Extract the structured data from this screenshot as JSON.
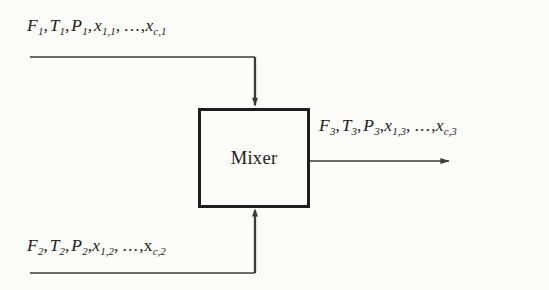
{
  "diagram": {
    "background_color": "#fbfbf8",
    "line_color": "#3a3a3a",
    "unit": {
      "name": "Mixer",
      "label": "Mixer",
      "shape": "rectangle",
      "x": 198,
      "y": 108,
      "width": 112,
      "height": 100,
      "border_color": "#1e1e1e",
      "border_width": 3,
      "fill": "none"
    },
    "streams": [
      {
        "id": "stream-1",
        "role": "inlet",
        "number": 1,
        "label_parts": [
          "F",
          "1",
          ", ",
          "T",
          "1",
          ", ",
          "P",
          "1",
          ", ",
          "x",
          "1,1",
          " , ",
          "...",
          ", ",
          "x",
          "c,1"
        ],
        "label_plain": "F1, T1, P1, x1,1 , ... , xc,1",
        "variables": [
          {
            "symbol": "F",
            "subscript": "1"
          },
          {
            "symbol": "T",
            "subscript": "1"
          },
          {
            "symbol": "P",
            "subscript": "1"
          },
          {
            "symbol": "x",
            "subscript": "1,1"
          },
          {
            "symbol": "ellipsis",
            "subscript": ""
          },
          {
            "symbol": "x",
            "subscript": "c,1"
          }
        ],
        "enters_at": "top",
        "arrow_direction": "down"
      },
      {
        "id": "stream-2",
        "role": "inlet",
        "number": 2,
        "label_parts": [
          "F",
          "2",
          ", ",
          "T",
          "2",
          ", ",
          "P",
          "2",
          ", ",
          "x",
          "1,2",
          " , ",
          "...",
          ", ",
          "x",
          "c,2"
        ],
        "label_plain": "F2, T2, P2, x1,2 , ... , xc,2",
        "variables": [
          {
            "symbol": "F",
            "subscript": "2"
          },
          {
            "symbol": "T",
            "subscript": "2"
          },
          {
            "symbol": "P",
            "subscript": "2"
          },
          {
            "symbol": "x",
            "subscript": "1,2"
          },
          {
            "symbol": "ellipsis",
            "subscript": ""
          },
          {
            "symbol": "x",
            "subscript": "c,2"
          }
        ],
        "enters_at": "bottom",
        "arrow_direction": "up"
      },
      {
        "id": "stream-3",
        "role": "outlet",
        "number": 3,
        "label_parts": [
          "F",
          "3",
          ", ",
          "T",
          "3",
          ", ",
          "P",
          "3",
          ", ",
          "x",
          "1,3",
          " , ",
          "...",
          ", ",
          "x",
          "c,3"
        ],
        "label_plain": "F3, T3, P3, x1,3 , ... , xc,3",
        "variables": [
          {
            "symbol": "F",
            "subscript": "3"
          },
          {
            "symbol": "T",
            "subscript": "3"
          },
          {
            "symbol": "P",
            "subscript": "3"
          },
          {
            "symbol": "x",
            "subscript": "1,3"
          },
          {
            "symbol": "ellipsis",
            "subscript": ""
          },
          {
            "symbol": "x",
            "subscript": "c,3"
          }
        ],
        "exits_at": "right",
        "arrow_direction": "right"
      }
    ],
    "symbols": {
      "F": "F",
      "T": "T",
      "P": "P",
      "x": "x",
      "ellipsis": "...",
      "comma": ",",
      "sub_1": "1",
      "sub_2": "2",
      "sub_3": "3",
      "sub_1_1": "1,1",
      "sub_c_1": "c,1",
      "sub_1_2": "1,2",
      "sub_c_2": "c,2",
      "sub_1_3": "1,3",
      "sub_c_3": "c,3"
    }
  }
}
